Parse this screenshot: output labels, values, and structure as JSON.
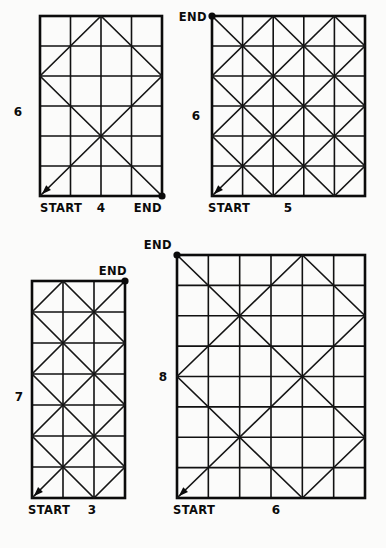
{
  "page": {
    "background_color": "#fbfbfa",
    "ink_color": "#0b0b0b",
    "width": 386,
    "height": 548
  },
  "labels": {
    "start": "START",
    "end": "END"
  },
  "chart_data": {
    "type": "diagram",
    "figures": [
      {
        "id": "figure-1",
        "cols": 4,
        "rows": 6,
        "width_label": "4",
        "height_label": "6",
        "start_label": "START",
        "end_label": "END",
        "start_corner": "bottom-left",
        "end_corner": "bottom-right",
        "geometry": {
          "x": 40,
          "y": 16,
          "w": 122,
          "h": 180
        },
        "width_label_pos": {
          "x": 101,
          "y": 212
        },
        "height_label_pos": {
          "x": 18,
          "y": 116
        },
        "start_label_pos": {
          "x": 40,
          "y": 212
        },
        "end_label_pos": {
          "x": 162,
          "y": 212
        },
        "start_label_anchor": "start",
        "end_label_anchor": "end",
        "height_label_anchor": "middle"
      },
      {
        "id": "figure-2",
        "cols": 5,
        "rows": 6,
        "width_label": "5",
        "height_label": "6",
        "start_label": "START",
        "end_label": "END",
        "start_corner": "bottom-left",
        "end_corner": "top-left",
        "geometry": {
          "x": 212,
          "y": 16,
          "w": 153,
          "h": 180
        },
        "width_label_pos": {
          "x": 288,
          "y": 212
        },
        "height_label_pos": {
          "x": 196,
          "y": 120
        },
        "start_label_pos": {
          "x": 208,
          "y": 212
        },
        "end_label_pos": {
          "x": 207,
          "y": 21
        },
        "start_label_anchor": "start",
        "end_label_anchor": "end",
        "height_label_anchor": "middle"
      },
      {
        "id": "figure-3",
        "cols": 3,
        "rows": 7,
        "width_label": "3",
        "height_label": "7",
        "start_label": "START",
        "end_label": "END",
        "start_corner": "bottom-left",
        "end_corner": "top-right",
        "geometry": {
          "x": 32,
          "y": 281,
          "w": 93,
          "h": 217
        },
        "width_label_pos": {
          "x": 92,
          "y": 514
        },
        "height_label_pos": {
          "x": 19,
          "y": 401
        },
        "start_label_pos": {
          "x": 28,
          "y": 514
        },
        "end_label_pos": {
          "x": 127,
          "y": 275
        },
        "start_label_anchor": "start",
        "end_label_anchor": "end",
        "height_label_anchor": "middle"
      },
      {
        "id": "figure-4",
        "cols": 6,
        "rows": 8,
        "width_label": "6",
        "height_label": "8",
        "start_label": "START",
        "end_label": "END",
        "start_corner": "bottom-left",
        "end_corner": "top-left",
        "geometry": {
          "x": 177,
          "y": 255,
          "w": 188,
          "h": 243
        },
        "width_label_pos": {
          "x": 276,
          "y": 514
        },
        "height_label_pos": {
          "x": 163,
          "y": 381
        },
        "start_label_pos": {
          "x": 173,
          "y": 514
        },
        "end_label_pos": {
          "x": 172,
          "y": 249
        },
        "start_label_anchor": "start",
        "end_label_anchor": "end",
        "height_label_anchor": "middle"
      }
    ]
  }
}
